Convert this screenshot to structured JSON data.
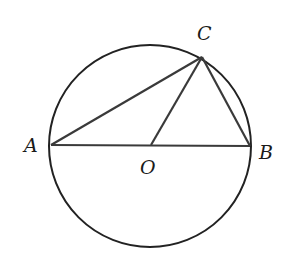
{
  "diagram": {
    "title": "",
    "points": {
      "A": {
        "label": "A",
        "x": 51,
        "y": 145
      },
      "B": {
        "label": "B",
        "x": 250,
        "y": 146
      },
      "C": {
        "label": "C",
        "x": 202,
        "y": 57
      },
      "O": {
        "label": "O",
        "x": 151,
        "y": 145
      }
    },
    "circle": {
      "center": "O",
      "cx": 150,
      "cy": 146,
      "r": 101
    },
    "segments": [
      "AB",
      "AC",
      "BC",
      "OC"
    ],
    "colors": {
      "stroke": "#222222",
      "segment": "#3a3a3a",
      "background": "#ffffff"
    }
  }
}
